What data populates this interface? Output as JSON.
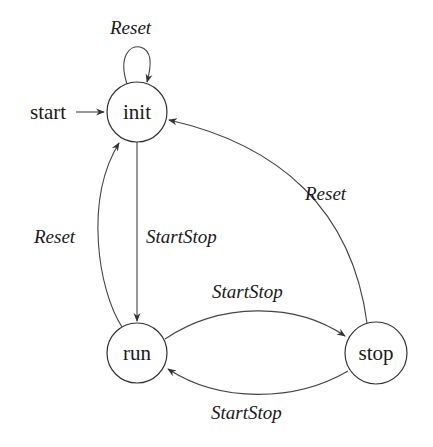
{
  "diagram": {
    "type": "finite-state-machine",
    "start_label": "start",
    "nodes": [
      {
        "id": "init",
        "label": "init"
      },
      {
        "id": "run",
        "label": "run"
      },
      {
        "id": "stop",
        "label": "stop"
      }
    ],
    "edges": [
      {
        "from": "init",
        "to": "init",
        "label": "Reset"
      },
      {
        "from": "init",
        "to": "run",
        "label": "StartStop"
      },
      {
        "from": "run",
        "to": "init",
        "label": "Reset"
      },
      {
        "from": "run",
        "to": "stop",
        "label": "StartStop"
      },
      {
        "from": "stop",
        "to": "run",
        "label": "StartStop"
      },
      {
        "from": "stop",
        "to": "init",
        "label": "Reset"
      }
    ]
  }
}
